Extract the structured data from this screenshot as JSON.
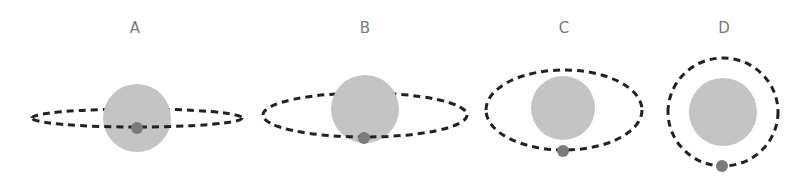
{
  "figure": {
    "colors": {
      "background": "#ffffff",
      "star": "#c4c4c4",
      "planet": "#7b7b7b",
      "orbit": "#222222",
      "label": "#7a7a7a"
    },
    "panels": [
      {
        "label": "A",
        "orbit": {
          "cx": 137,
          "cy": 118,
          "rx": 105,
          "ry": 9
        },
        "star": {
          "cx": 137,
          "cy": 118,
          "r": 34
        },
        "planet": {
          "cx": 137,
          "cy": 128,
          "r": 6
        },
        "label_pos": {
          "x": 135,
          "y": 33
        }
      },
      {
        "label": "B",
        "orbit": {
          "cx": 365,
          "cy": 115,
          "rx": 102,
          "ry": 22
        },
        "star": {
          "cx": 365,
          "cy": 109,
          "r": 34
        },
        "planet": {
          "cx": 364,
          "cy": 138,
          "r": 6
        },
        "label_pos": {
          "x": 365,
          "y": 33
        }
      },
      {
        "label": "C",
        "orbit": {
          "cx": 564,
          "cy": 110,
          "rx": 78,
          "ry": 40
        },
        "star": {
          "cx": 563,
          "cy": 108,
          "r": 32
        },
        "planet": {
          "cx": 563,
          "cy": 151,
          "r": 6
        },
        "label_pos": {
          "x": 564,
          "y": 33
        }
      },
      {
        "label": "D",
        "orbit": {
          "cx": 723,
          "cy": 112,
          "rx": 55,
          "ry": 54
        },
        "star": {
          "cx": 723,
          "cy": 112,
          "r": 34
        },
        "planet": {
          "cx": 722,
          "cy": 166,
          "r": 6
        },
        "label_pos": {
          "x": 724,
          "y": 33
        }
      }
    ]
  }
}
